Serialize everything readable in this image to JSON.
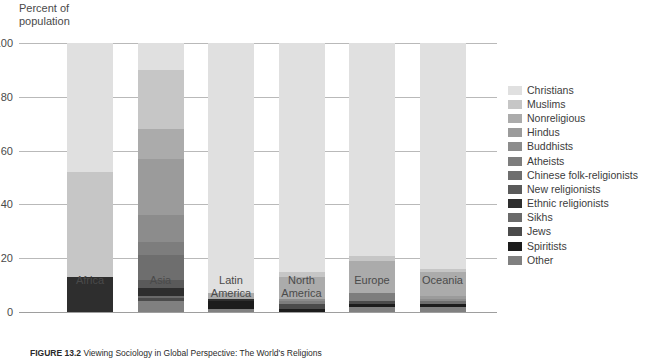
{
  "axis_title": "Percent of\npopulation",
  "caption": {
    "figure_label": "FIGURE 13.2",
    "text": "Viewing Sociology in Global Perspective: The World's Religions"
  },
  "legend": {
    "items": [
      {
        "label": "Christians",
        "color": "#e0e0e0"
      },
      {
        "label": "Muslims",
        "color": "#c6c6c6"
      },
      {
        "label": "Nonreligious",
        "color": "#ababab"
      },
      {
        "label": "Hindus",
        "color": "#9b9b9b"
      },
      {
        "label": "Buddhists",
        "color": "#8c8c8c"
      },
      {
        "label": "Atheists",
        "color": "#7d7d7d"
      },
      {
        "label": "Chinese folk-religionists",
        "color": "#6e6e6e"
      },
      {
        "label": "New religionists",
        "color": "#5a5a5a"
      },
      {
        "label": "Ethnic religionists",
        "color": "#2e2e2e"
      },
      {
        "label": "Sikhs",
        "color": "#6a6a6a"
      },
      {
        "label": "Jews",
        "color": "#4b4b4b"
      },
      {
        "label": "Spiritists",
        "color": "#1c1c1c"
      },
      {
        "label": "Other",
        "color": "#808080"
      }
    ]
  },
  "chart_data": {
    "type": "bar",
    "stacked": true,
    "title": "",
    "xlabel": "",
    "ylabel": "Percent of population",
    "ylim": [
      0,
      100
    ],
    "yticks": [
      0,
      20,
      40,
      60,
      80,
      100
    ],
    "grid": true,
    "legend_position": "right",
    "categories": [
      "Africa",
      "Asia",
      "Latin\nAmerica",
      "North\nAmerica",
      "Europe",
      "Oceania"
    ],
    "series": [
      {
        "name": "Christians",
        "color": "#e0e0e0",
        "values": [
          48,
          10,
          93,
          85,
          79,
          84
        ]
      },
      {
        "name": "Muslims",
        "color": "#c6c6c6",
        "values": [
          39,
          22,
          0,
          2,
          2,
          1
        ]
      },
      {
        "name": "Nonreligious",
        "color": "#ababab",
        "values": [
          0,
          11,
          2,
          8,
          12,
          9
        ]
      },
      {
        "name": "Hindus",
        "color": "#9b9b9b",
        "values": [
          0,
          21,
          0,
          0,
          0,
          1
        ]
      },
      {
        "name": "Buddhists",
        "color": "#8c8c8c",
        "values": [
          0,
          10,
          0,
          1,
          0,
          1
        ]
      },
      {
        "name": "Atheists",
        "color": "#7d7d7d",
        "values": [
          0,
          5,
          0,
          1,
          3,
          0
        ]
      },
      {
        "name": "Chinese folk-religionists",
        "color": "#6e6e6e",
        "values": [
          0,
          9,
          0,
          0,
          0,
          1
        ]
      },
      {
        "name": "New religionists",
        "color": "#5a5a5a",
        "values": [
          0,
          3,
          0,
          0,
          0,
          0
        ]
      },
      {
        "name": "Ethnic religionists",
        "color": "#2e2e2e",
        "values": [
          13,
          3,
          1,
          0,
          0,
          0
        ]
      },
      {
        "name": "Sikhs",
        "color": "#6a6a6a",
        "values": [
          0,
          1,
          0,
          0,
          0,
          0
        ]
      },
      {
        "name": "Jews",
        "color": "#4b4b4b",
        "values": [
          0,
          1,
          0,
          2,
          1,
          0
        ]
      },
      {
        "name": "Spiritists",
        "color": "#1c1c1c",
        "values": [
          0,
          0,
          3,
          1,
          1,
          1
        ]
      },
      {
        "name": "Other",
        "color": "#808080",
        "values": [
          0,
          4,
          1,
          0,
          2,
          2
        ]
      }
    ]
  }
}
